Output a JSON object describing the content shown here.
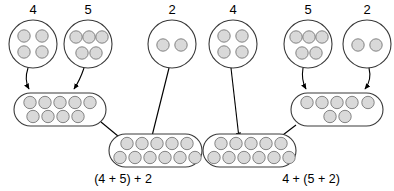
{
  "diagram": {
    "dot_fill_color": "#d9d9d9",
    "dot_stroke_color": "#777777",
    "outline_color": "#3a3a3a",
    "arrow_color": "#000000",
    "panels": [
      {
        "id": "left-panel",
        "expression_label": "(4 + 5) + 2",
        "source_groups": [
          {
            "id": "left-circle-4",
            "label": "4",
            "dot_count": 4,
            "rows": [
              2,
              2
            ]
          },
          {
            "id": "left-circle-5",
            "label": "5",
            "dot_count": 5,
            "rows": [
              3,
              2
            ]
          },
          {
            "id": "left-circle-2",
            "label": "2",
            "dot_count": 2,
            "rows": [
              2
            ]
          }
        ],
        "intermediate_group": {
          "id": "left-sum-9",
          "dot_count": 9,
          "rows": [
            5,
            4
          ],
          "from": [
            "left-circle-4",
            "left-circle-5"
          ]
        },
        "result_group": {
          "id": "left-sum-11",
          "dot_count": 11,
          "rows": [
            5,
            6
          ],
          "from": [
            "left-sum-9",
            "left-circle-2"
          ]
        }
      },
      {
        "id": "right-panel",
        "expression_label": "4 + (5 + 2)",
        "source_groups": [
          {
            "id": "right-circle-4",
            "label": "4",
            "dot_count": 4,
            "rows": [
              2,
              2
            ]
          },
          {
            "id": "right-circle-5",
            "label": "5",
            "dot_count": 5,
            "rows": [
              3,
              2
            ]
          },
          {
            "id": "right-circle-2",
            "label": "2",
            "dot_count": 2,
            "rows": [
              2
            ]
          }
        ],
        "intermediate_group": {
          "id": "right-sum-7",
          "dot_count": 7,
          "rows": [
            5,
            2
          ],
          "from": [
            "right-circle-5",
            "right-circle-2"
          ]
        },
        "result_group": {
          "id": "right-sum-11",
          "dot_count": 11,
          "rows": [
            5,
            6
          ],
          "from": [
            "right-circle-4",
            "right-sum-7"
          ]
        }
      }
    ],
    "labels": {
      "left_count_4": "4",
      "left_count_5": "5",
      "left_count_2": "2",
      "right_count_4": "4",
      "right_count_5": "5",
      "right_count_2": "2",
      "left_expression": "(4 + 5) + 2",
      "right_expression": "4 + (5 + 2)"
    }
  }
}
